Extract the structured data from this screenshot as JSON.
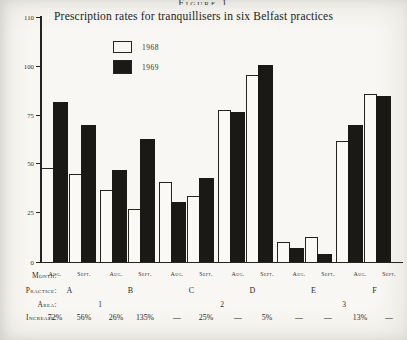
{
  "figure": {
    "caption": "Figure 1"
  },
  "chart": {
    "title": "Prescription rates for tranquillisers in six Belfast practices",
    "legend": [
      {
        "label": "1968",
        "fill": "#faf9f5"
      },
      {
        "label": "1969",
        "fill": "#1a1916"
      }
    ],
    "y_ticks": [
      "110",
      "100",
      "75",
      "50",
      "25",
      "0"
    ]
  },
  "chart_data": {
    "type": "bar",
    "title": "Prescription rates for tranquillisers in six Belfast practices",
    "categories": [
      "A Aug.",
      "A Sept.",
      "B Aug.",
      "B Sept.",
      "C Aug.",
      "C Sept.",
      "D Aug.",
      "D Sept.",
      "E Aug.",
      "E Sept.",
      "F Aug.",
      "F Sept."
    ],
    "months": [
      "Aug.",
      "Sept.",
      "Aug.",
      "Sept.",
      "Aug.",
      "Sept.",
      "Aug.",
      "Sept.",
      "Aug.",
      "Sept.",
      "Aug.",
      "Sept."
    ],
    "series": [
      {
        "name": "1968",
        "values": [
          48,
          45,
          37,
          27,
          41,
          34,
          78,
          96,
          10,
          13,
          62,
          86
        ]
      },
      {
        "name": "1969",
        "values": [
          82,
          70,
          47,
          63,
          31,
          43,
          77,
          101,
          7,
          4,
          70,
          85
        ]
      }
    ],
    "xlabel": "",
    "ylabel": "",
    "ylim": [
      0,
      110
    ],
    "grid": false,
    "legend_position": "upper-left-inside",
    "bar_colors": {
      "1968": "white-outlined",
      "1969": "black"
    }
  },
  "table": {
    "rows": [
      {
        "label": "Month:",
        "values": [
          "Aug.",
          "Sept.",
          "Aug.",
          "Sept.",
          "Aug.",
          "Sept.",
          "Aug.",
          "Sept.",
          "Aug.",
          "Sept.",
          "Aug.",
          "Sept."
        ]
      },
      {
        "label": "Practice:",
        "values": [
          "A",
          "B",
          "C",
          "D",
          "E",
          "F"
        ]
      },
      {
        "label": "Area:",
        "values": [
          "1",
          "2",
          "3"
        ]
      },
      {
        "label": "Increase:",
        "values": [
          "72%",
          "56%",
          "26%",
          "135%",
          "—",
          "25%",
          "—",
          "5%",
          "—",
          "—",
          "13%",
          "—"
        ]
      }
    ]
  }
}
